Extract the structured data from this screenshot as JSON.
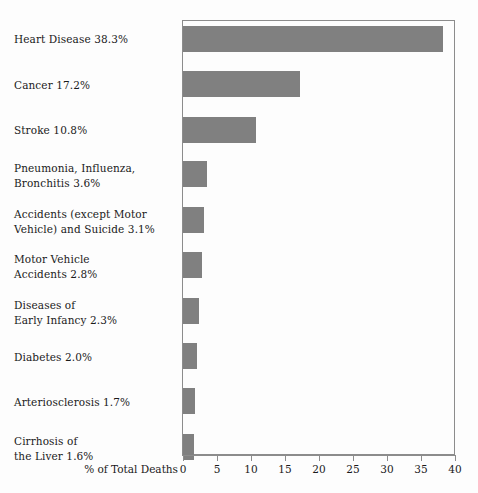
{
  "chart_data": {
    "type": "bar",
    "orientation": "horizontal",
    "title": "",
    "xlabel": "% of Total Deaths",
    "ylabel": "",
    "xlim": [
      0,
      40
    ],
    "xticks": [
      0,
      5,
      10,
      15,
      20,
      25,
      30,
      35,
      40
    ],
    "xtick_labels": [
      "0",
      "5",
      "10",
      "15",
      "20",
      "25",
      "30",
      "35",
      "40"
    ],
    "grid": false,
    "legend": false,
    "bar_color": "#808080",
    "frame_color": "#8c8c8c",
    "background": "#fdfdfd",
    "categories": [
      "Heart Disease",
      "Cancer",
      "Stroke",
      "Pneumonia, Influenza,\nBronchitis",
      "Accidents (except Motor\nVehicle) and Suicide",
      "Motor Vehicle\nAccidents",
      "Diseases of\nEarly Infancy",
      "Diabetes",
      "Arteriosclerosis",
      "Cirrhosis of\nthe Liver"
    ],
    "values": [
      38.3,
      17.2,
      10.8,
      3.6,
      3.1,
      2.8,
      2.3,
      2.0,
      1.7,
      1.6
    ],
    "labels": [
      "Heart Disease 38.3%",
      "Cancer 17.2%",
      "Stroke 10.8%",
      "Pneumonia, Influenza,\nBronchitis 3.6%",
      "Accidents (except Motor\nVehicle) and Suicide 3.1%",
      "Motor Vehicle\nAccidents 2.8%",
      "Diseases of\nEarly Infancy 2.3%",
      "Diabetes 2.0%",
      "Arteriosclerosis 1.7%",
      "Cirrhosis of\nthe Liver 1.6%"
    ]
  }
}
